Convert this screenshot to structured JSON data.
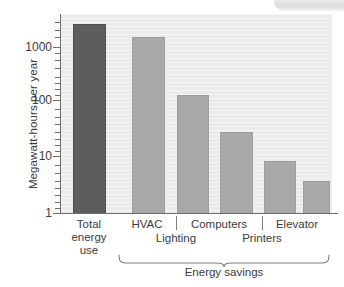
{
  "chart_data": {
    "type": "bar",
    "title": "",
    "subtitle": "",
    "xlabel": "",
    "ylabel": "Megawatt-hours per year",
    "yscale": "log",
    "ylim": [
      1,
      4000
    ],
    "grid": false,
    "legend": null,
    "categories": [
      "Total energy use",
      "HVAC",
      "Lighting",
      "Computers",
      "Printers",
      "Elevator"
    ],
    "values": [
      2700,
      1600,
      140,
      30,
      9,
      4
    ],
    "series": [
      {
        "name": "Megawatt-hours per year",
        "values": [
          2700,
          1600,
          140,
          30,
          9,
          4
        ]
      }
    ],
    "bars": [
      {
        "label_line1": "Total",
        "label_line2": "energy",
        "label_line3": "use",
        "value": 2700,
        "color": "#5d5d5d",
        "group": "total"
      },
      {
        "label_line1": "HVAC",
        "label_line2": "",
        "label_line3": "",
        "value": 1600,
        "color": "#a9a9a9",
        "group": "savings"
      },
      {
        "label_line1": "Lighting",
        "label_line2": "",
        "label_line3": "",
        "value": 140,
        "color": "#a9a9a9",
        "group": "savings"
      },
      {
        "label_line1": "Computers",
        "label_line2": "",
        "label_line3": "",
        "value": 30,
        "color": "#a9a9a9",
        "group": "savings"
      },
      {
        "label_line1": "Printers",
        "label_line2": "",
        "label_line3": "",
        "value": 9,
        "color": "#a9a9a9",
        "group": "savings"
      },
      {
        "label_line1": "Elevator",
        "label_line2": "",
        "label_line3": "",
        "value": 4,
        "color": "#a9a9a9",
        "group": "savings"
      }
    ],
    "ytick_labels": [
      "1",
      "10",
      "100",
      "1000"
    ],
    "ytick_values": [
      1,
      10,
      100,
      1000
    ],
    "group_bracket_label": "Energy savings",
    "colors": {
      "total_bar": "#5d5d5d",
      "savings_bar": "#a9a9a9",
      "plot_background": "#ebebeb",
      "axis": "#6d6d6d",
      "text": "#3c3c3c"
    }
  },
  "axis": {
    "y_title": "Megawatt-hours per year",
    "ticks": {
      "t1000": "1000",
      "t100": "100",
      "t10": "10",
      "t1": "1"
    }
  },
  "xlabels": {
    "total_l1": "Total",
    "total_l2": "energy",
    "total_l3": "use",
    "hvac": "HVAC",
    "lighting": "Lighting",
    "computers": "Computers",
    "printers": "Printers",
    "elevator": "Elevator"
  },
  "group": {
    "bracket_label": "Energy savings"
  }
}
